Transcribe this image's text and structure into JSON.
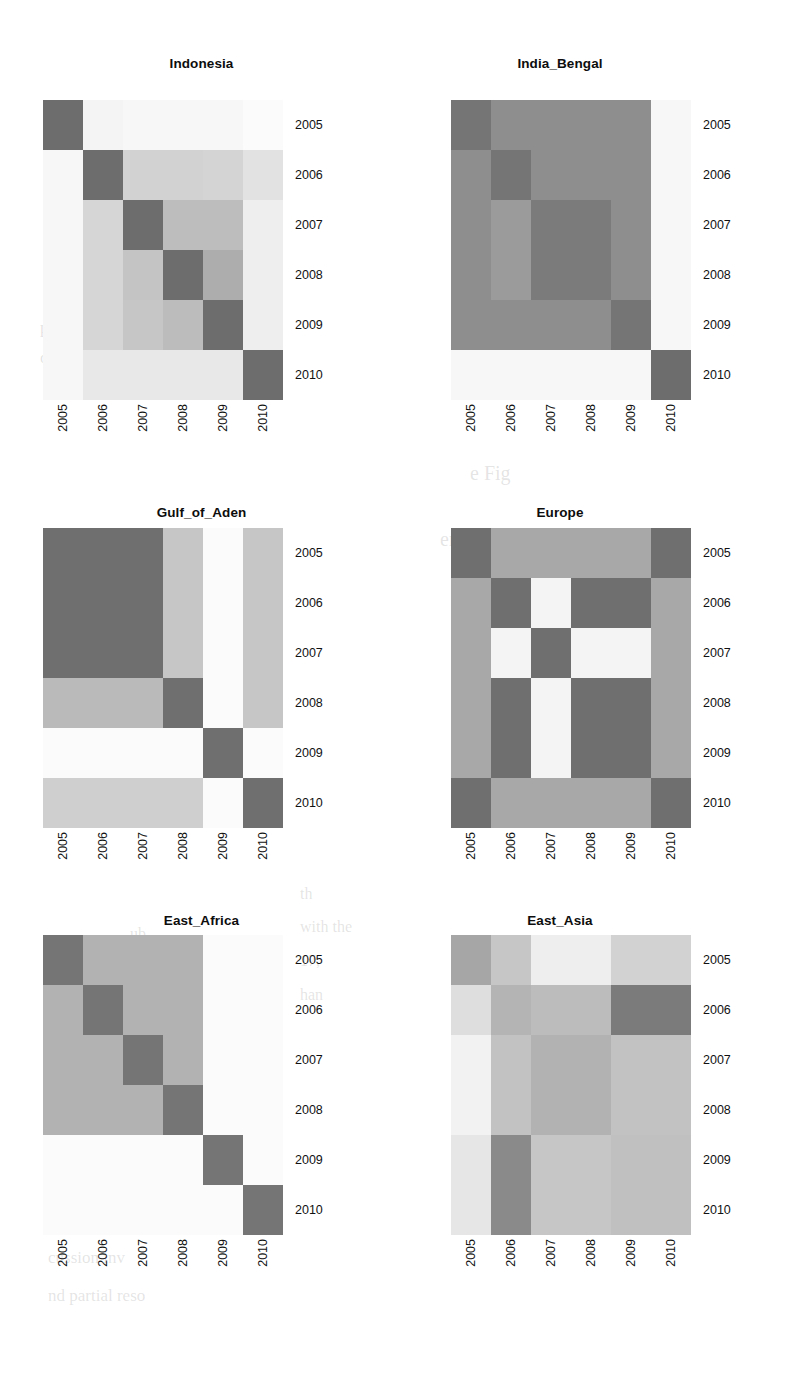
{
  "figure": {
    "type": "small-multiples-heatmap-grid",
    "rows": 3,
    "cols": 2,
    "background": "#ffffff",
    "text_color": "#111111"
  },
  "axis": {
    "categories": [
      "2005",
      "2006",
      "2007",
      "2008",
      "2009",
      "2010"
    ],
    "x_tick_rotation": 90,
    "y_tick_side": "right"
  },
  "colormap": {
    "name": "grayscale",
    "description": "darker = higher value",
    "stops": {
      "darkest": "#6d6d6d",
      "dark": "#7b7b7b",
      "mid_dark": "#8e8e8e",
      "mid": "#9e9e9e",
      "mid_light": "#b4b4b4",
      "light": "#c8c8c8",
      "lighter": "#d8d8d8",
      "pale": "#e8e8e8",
      "near_white": "#f2f2f2",
      "white": "#fbfbfb"
    }
  },
  "chart_data": [
    {
      "type": "heatmap",
      "title": "Indonesia",
      "xlabel": "",
      "ylabel": "",
      "categories": [
        "2005",
        "2006",
        "2007",
        "2008",
        "2009",
        "2010"
      ],
      "rows": [
        "2005",
        "2006",
        "2007",
        "2008",
        "2009",
        "2010"
      ],
      "cells": [
        [
          "#6d6d6d",
          "#f4f4f4",
          "#f7f7f7",
          "#f7f7f7",
          "#f7f7f7",
          "#fbfbfb"
        ],
        [
          "#f7f7f7",
          "#6d6d6d",
          "#d2d2d2",
          "#d2d2d2",
          "#d4d4d4",
          "#e2e2e2"
        ],
        [
          "#f7f7f7",
          "#d6d6d6",
          "#6d6d6d",
          "#bdbdbd",
          "#bdbdbd",
          "#eeeeee"
        ],
        [
          "#f7f7f7",
          "#d6d6d6",
          "#c4c4c4",
          "#6d6d6d",
          "#adadad",
          "#eeeeee"
        ],
        [
          "#f7f7f7",
          "#d6d6d6",
          "#c6c6c6",
          "#bcbcbc",
          "#6d6d6d",
          "#eeeeee"
        ],
        [
          "#f7f7f7",
          "#e8e8e8",
          "#e8e8e8",
          "#e8e8e8",
          "#e8e8e8",
          "#6d6d6d"
        ]
      ],
      "values": [
        [
          1.0,
          0.03,
          0.02,
          0.02,
          0.02,
          0.0
        ],
        [
          0.02,
          1.0,
          0.2,
          0.2,
          0.19,
          0.12
        ],
        [
          0.02,
          0.18,
          1.0,
          0.29,
          0.29,
          0.05
        ],
        [
          0.02,
          0.18,
          0.24,
          1.0,
          0.35,
          0.05
        ],
        [
          0.02,
          0.18,
          0.23,
          0.27,
          1.0,
          0.05
        ],
        [
          0.02,
          0.09,
          0.09,
          0.09,
          0.09,
          1.0
        ]
      ]
    },
    {
      "type": "heatmap",
      "title": "India_Bengal",
      "xlabel": "",
      "ylabel": "",
      "categories": [
        "2005",
        "2006",
        "2007",
        "2008",
        "2009",
        "2010"
      ],
      "rows": [
        "2005",
        "2006",
        "2007",
        "2008",
        "2009",
        "2010"
      ],
      "cells": [
        [
          "#757575",
          "#8e8e8e",
          "#8e8e8e",
          "#8e8e8e",
          "#8e8e8e",
          "#f7f7f7"
        ],
        [
          "#8e8e8e",
          "#757575",
          "#8e8e8e",
          "#8e8e8e",
          "#8e8e8e",
          "#f7f7f7"
        ],
        [
          "#8e8e8e",
          "#9b9b9b",
          "#7b7b7b",
          "#7b7b7b",
          "#8e8e8e",
          "#f7f7f7"
        ],
        [
          "#8e8e8e",
          "#9b9b9b",
          "#7b7b7b",
          "#7b7b7b",
          "#8e8e8e",
          "#f7f7f7"
        ],
        [
          "#8e8e8e",
          "#8e8e8e",
          "#8e8e8e",
          "#8e8e8e",
          "#757575",
          "#f7f7f7"
        ],
        [
          "#f7f7f7",
          "#f7f7f7",
          "#f7f7f7",
          "#f7f7f7",
          "#f7f7f7",
          "#6d6d6d"
        ]
      ],
      "values": [
        [
          1.0,
          0.72,
          0.72,
          0.72,
          0.72,
          0.02
        ],
        [
          0.72,
          1.0,
          0.72,
          0.72,
          0.72,
          0.02
        ],
        [
          0.72,
          0.66,
          0.85,
          0.85,
          0.72,
          0.02
        ],
        [
          0.72,
          0.66,
          0.85,
          0.85,
          0.72,
          0.02
        ],
        [
          0.72,
          0.72,
          0.72,
          0.72,
          1.0,
          0.02
        ],
        [
          0.02,
          0.02,
          0.02,
          0.02,
          0.02,
          1.0
        ]
      ]
    },
    {
      "type": "heatmap",
      "title": "Gulf_of_Aden",
      "xlabel": "",
      "ylabel": "",
      "categories": [
        "2005",
        "2006",
        "2007",
        "2008",
        "2009",
        "2010"
      ],
      "rows": [
        "2005",
        "2006",
        "2007",
        "2008",
        "2009",
        "2010"
      ],
      "cells": [
        [
          "#6f6f6f",
          "#6f6f6f",
          "#6f6f6f",
          "#c6c6c6",
          "#fbfbfb",
          "#c6c6c6"
        ],
        [
          "#6f6f6f",
          "#6f6f6f",
          "#6f6f6f",
          "#c6c6c6",
          "#fbfbfb",
          "#c6c6c6"
        ],
        [
          "#6f6f6f",
          "#6f6f6f",
          "#6f6f6f",
          "#c6c6c6",
          "#fbfbfb",
          "#c6c6c6"
        ],
        [
          "#bababa",
          "#bababa",
          "#bababa",
          "#6f6f6f",
          "#fbfbfb",
          "#c6c6c6"
        ],
        [
          "#fbfbfb",
          "#fbfbfb",
          "#fbfbfb",
          "#fbfbfb",
          "#6f6f6f",
          "#fbfbfb"
        ],
        [
          "#cfcfcf",
          "#cfcfcf",
          "#cfcfcf",
          "#cfcfcf",
          "#fbfbfb",
          "#6f6f6f"
        ]
      ],
      "values": [
        [
          1.0,
          1.0,
          1.0,
          0.23,
          0.0,
          0.23
        ],
        [
          1.0,
          1.0,
          1.0,
          0.23,
          0.0,
          0.23
        ],
        [
          1.0,
          1.0,
          1.0,
          0.23,
          0.0,
          0.23
        ],
        [
          0.28,
          0.28,
          0.28,
          1.0,
          0.0,
          0.23
        ],
        [
          0.0,
          0.0,
          0.0,
          0.0,
          1.0,
          0.0
        ],
        [
          0.19,
          0.19,
          0.19,
          0.19,
          0.0,
          1.0
        ]
      ]
    },
    {
      "type": "heatmap",
      "title": "Europe",
      "xlabel": "",
      "ylabel": "",
      "categories": [
        "2005",
        "2006",
        "2007",
        "2008",
        "2009",
        "2010"
      ],
      "rows": [
        "2005",
        "2006",
        "2007",
        "2008",
        "2009",
        "2010"
      ],
      "cells": [
        [
          "#6f6f6f",
          "#a8a8a8",
          "#a8a8a8",
          "#a8a8a8",
          "#a8a8a8",
          "#6f6f6f"
        ],
        [
          "#a8a8a8",
          "#6f6f6f",
          "#f4f4f4",
          "#6f6f6f",
          "#6f6f6f",
          "#a8a8a8"
        ],
        [
          "#a8a8a8",
          "#f4f4f4",
          "#6f6f6f",
          "#f4f4f4",
          "#f4f4f4",
          "#a8a8a8"
        ],
        [
          "#a8a8a8",
          "#6f6f6f",
          "#f4f4f4",
          "#6f6f6f",
          "#6f6f6f",
          "#a8a8a8"
        ],
        [
          "#a8a8a8",
          "#6f6f6f",
          "#f4f4f4",
          "#6f6f6f",
          "#6f6f6f",
          "#a8a8a8"
        ],
        [
          "#6f6f6f",
          "#a8a8a8",
          "#a8a8a8",
          "#a8a8a8",
          "#a8a8a8",
          "#6f6f6f"
        ]
      ],
      "values": [
        [
          1.0,
          0.42,
          0.42,
          0.42,
          0.42,
          1.0
        ],
        [
          0.42,
          1.0,
          0.03,
          1.0,
          1.0,
          0.42
        ],
        [
          0.42,
          0.03,
          1.0,
          0.03,
          0.03,
          0.42
        ],
        [
          0.42,
          1.0,
          0.03,
          1.0,
          1.0,
          0.42
        ],
        [
          0.42,
          1.0,
          0.03,
          1.0,
          1.0,
          0.42
        ],
        [
          1.0,
          0.42,
          0.42,
          0.42,
          0.42,
          1.0
        ]
      ]
    },
    {
      "type": "heatmap",
      "title": "East_Africa",
      "xlabel": "",
      "ylabel": "",
      "categories": [
        "2005",
        "2006",
        "2007",
        "2008",
        "2009",
        "2010"
      ],
      "rows": [
        "2005",
        "2006",
        "2007",
        "2008",
        "2009",
        "2010"
      ],
      "cells": [
        [
          "#757575",
          "#b2b2b2",
          "#b2b2b2",
          "#b2b2b2",
          "#fbfbfb",
          "#fbfbfb"
        ],
        [
          "#b2b2b2",
          "#757575",
          "#b2b2b2",
          "#b2b2b2",
          "#fbfbfb",
          "#fbfbfb"
        ],
        [
          "#b2b2b2",
          "#b2b2b2",
          "#757575",
          "#b2b2b2",
          "#fbfbfb",
          "#fbfbfb"
        ],
        [
          "#b2b2b2",
          "#b2b2b2",
          "#b2b2b2",
          "#757575",
          "#fbfbfb",
          "#fbfbfb"
        ],
        [
          "#fbfbfb",
          "#fbfbfb",
          "#fbfbfb",
          "#fbfbfb",
          "#757575",
          "#fbfbfb"
        ],
        [
          "#fbfbfb",
          "#fbfbfb",
          "#fbfbfb",
          "#fbfbfb",
          "#fbfbfb",
          "#757575"
        ]
      ],
      "values": [
        [
          1.0,
          0.32,
          0.32,
          0.32,
          0.0,
          0.0
        ],
        [
          0.32,
          1.0,
          0.32,
          0.32,
          0.0,
          0.0
        ],
        [
          0.32,
          0.32,
          1.0,
          0.32,
          0.0,
          0.0
        ],
        [
          0.32,
          0.32,
          0.32,
          1.0,
          0.0,
          0.0
        ],
        [
          0.0,
          0.0,
          0.0,
          0.0,
          1.0,
          0.0
        ],
        [
          0.0,
          0.0,
          0.0,
          0.0,
          0.0,
          1.0
        ]
      ]
    },
    {
      "type": "heatmap",
      "title": "East_Asia",
      "xlabel": "",
      "ylabel": "",
      "categories": [
        "2005",
        "2006",
        "2007",
        "2008",
        "2009",
        "2010"
      ],
      "rows": [
        "2005",
        "2006",
        "2007",
        "2008",
        "2009",
        "2010"
      ],
      "cells": [
        [
          "#a6a6a6",
          "#c6c6c6",
          "#eeeeee",
          "#eeeeee",
          "#d2d2d2",
          "#d2d2d2"
        ],
        [
          "#dedede",
          "#b4b4b4",
          "#bcbcbc",
          "#bcbcbc",
          "#7b7b7b",
          "#7b7b7b"
        ],
        [
          "#f2f2f2",
          "#c2c2c2",
          "#b2b2b2",
          "#b2b2b2",
          "#c2c2c2",
          "#c2c2c2"
        ],
        [
          "#f2f2f2",
          "#c2c2c2",
          "#b2b2b2",
          "#b2b2b2",
          "#c2c2c2",
          "#c2c2c2"
        ],
        [
          "#e6e6e6",
          "#8a8a8a",
          "#c6c6c6",
          "#c6c6c6",
          "#c0c0c0",
          "#c0c0c0"
        ],
        [
          "#e6e6e6",
          "#8a8a8a",
          "#c6c6c6",
          "#c6c6c6",
          "#c0c0c0",
          "#c0c0c0"
        ]
      ],
      "values": [
        [
          0.46,
          0.28,
          0.07,
          0.07,
          0.2,
          0.2
        ],
        [
          0.13,
          0.36,
          0.33,
          0.33,
          0.78,
          0.78
        ],
        [
          0.04,
          0.3,
          0.37,
          0.37,
          0.3,
          0.3
        ],
        [
          0.04,
          0.3,
          0.37,
          0.37,
          0.3,
          0.3
        ],
        [
          0.09,
          0.62,
          0.28,
          0.28,
          0.31,
          0.31
        ],
        [
          0.09,
          0.62,
          0.28,
          0.28,
          0.31,
          0.31
        ]
      ]
    }
  ],
  "bleed_text": [
    {
      "text": "pp",
      "x": 40,
      "y": 318,
      "size": 17
    },
    {
      "text": "one a cant",
      "x": 40,
      "y": 348,
      "size": 17
    },
    {
      "text": "processing the",
      "x": 560,
      "y": 338,
      "size": 17
    },
    {
      "text": "algorithm wit",
      "x": 566,
      "y": 362,
      "size": 17
    },
    {
      "text": "e Fig",
      "x": 470,
      "y": 462,
      "size": 20
    },
    {
      "text": "ers of their earth",
      "x": 440,
      "y": 528,
      "size": 20
    },
    {
      "text": "en a",
      "x": 470,
      "y": 560,
      "size": 17
    },
    {
      "text": "ore",
      "x": 470,
      "y": 596,
      "size": 17
    },
    {
      "text": "ces",
      "x": 470,
      "y": 640,
      "size": 17
    },
    {
      "text": "ries",
      "x": 470,
      "y": 676,
      "size": 17
    },
    {
      "text": "an",
      "x": 470,
      "y": 712,
      "size": 17
    },
    {
      "text": "dele",
      "x": 165,
      "y": 748,
      "size": 17
    },
    {
      "text": "l",
      "x": 210,
      "y": 778,
      "size": 17
    },
    {
      "text": "th",
      "x": 300,
      "y": 885,
      "size": 16
    },
    {
      "text": "ub",
      "x": 130,
      "y": 925,
      "size": 16
    },
    {
      "text": "with the",
      "x": 300,
      "y": 918,
      "size": 16
    },
    {
      "text": "17, ",
      "x": 300,
      "y": 952,
      "size": 16
    },
    {
      "text": "han",
      "x": 300,
      "y": 986,
      "size": 16
    },
    {
      "text": "prob",
      "x": 470,
      "y": 1012,
      "size": 16
    },
    {
      "text": "and bhi",
      "x": 190,
      "y": 1062,
      "size": 16
    },
    {
      "text": "tracts",
      "x": 190,
      "y": 1092,
      "size": 16
    },
    {
      "text": "ortio alle onte",
      "x": 48,
      "y": 1210,
      "size": 17
    },
    {
      "text": "cussion inv",
      "x": 48,
      "y": 1248,
      "size": 17
    },
    {
      "text": "nd partial reso",
      "x": 48,
      "y": 1286,
      "size": 17
    }
  ]
}
